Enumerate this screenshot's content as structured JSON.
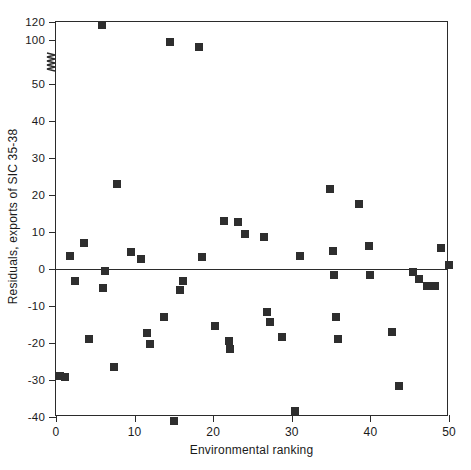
{
  "chart_data": {
    "type": "scatter",
    "title": "",
    "xlabel": "Environmental ranking",
    "ylabel": "Residuals, exports of SIC 35-38",
    "xlim": [
      0,
      50
    ],
    "ylim": [
      -40,
      120
    ],
    "grid": false,
    "legend": null,
    "axis_break": {
      "axis": "y",
      "between": [
        50,
        100
      ],
      "note": "broken y-axis squiggle drawn between the 50 and 100 ticks"
    },
    "xticks": [
      0,
      10,
      20,
      30,
      40,
      50
    ],
    "xtick_labels": [
      "0",
      "10",
      "20",
      "30",
      "40",
      "50"
    ],
    "yticks": [
      -40,
      -30,
      -20,
      -10,
      0,
      10,
      20,
      30,
      40,
      50,
      100,
      120
    ],
    "ytick_labels": [
      "-40",
      "-30",
      "-20",
      "-10",
      "0",
      "10",
      "20",
      "30",
      "40",
      "50",
      "100",
      "120"
    ],
    "reference_lines": [
      {
        "axis": "y",
        "value": 0
      }
    ],
    "marker": {
      "shape": "square",
      "color": "#2e2e2e",
      "size_px": 8
    },
    "series": [
      {
        "name": "Residuals, exports of SIC 35-38",
        "points": [
          [
            0.5,
            -29.0
          ],
          [
            1.2,
            -29.2
          ],
          [
            1.8,
            3.5
          ],
          [
            2.4,
            -3.3
          ],
          [
            3.5,
            7.0
          ],
          [
            4.2,
            -19.0
          ],
          [
            5.8,
            117.0
          ],
          [
            6.0,
            -5.0
          ],
          [
            6.2,
            -0.6
          ],
          [
            7.4,
            -26.5
          ],
          [
            7.8,
            23.0
          ],
          [
            9.6,
            4.6
          ],
          [
            10.8,
            2.8
          ],
          [
            11.6,
            -17.4
          ],
          [
            12.0,
            -20.2
          ],
          [
            13.8,
            -13.0
          ],
          [
            14.5,
            98.0
          ],
          [
            15.0,
            -41.0
          ],
          [
            15.8,
            -5.5
          ],
          [
            16.2,
            -3.2
          ],
          [
            18.2,
            92.0
          ],
          [
            18.6,
            3.2
          ],
          [
            20.2,
            -15.5
          ],
          [
            21.4,
            13.0
          ],
          [
            22.0,
            -19.3
          ],
          [
            22.2,
            -21.6
          ],
          [
            23.2,
            12.8
          ],
          [
            24.0,
            9.6
          ],
          [
            26.4,
            8.8
          ],
          [
            26.8,
            -11.5
          ],
          [
            27.2,
            -14.2
          ],
          [
            28.8,
            -18.3
          ],
          [
            30.4,
            -38.5
          ],
          [
            31.0,
            3.6
          ],
          [
            34.8,
            21.6
          ],
          [
            35.2,
            4.8
          ],
          [
            35.4,
            -1.5
          ],
          [
            35.6,
            -13.0
          ],
          [
            35.9,
            -19.0
          ],
          [
            38.6,
            17.6
          ],
          [
            39.8,
            6.2
          ],
          [
            40.0,
            -1.5
          ],
          [
            42.8,
            -17.0
          ],
          [
            43.6,
            -31.5
          ],
          [
            45.4,
            -0.8
          ],
          [
            46.2,
            -2.6
          ],
          [
            47.2,
            -4.6
          ],
          [
            48.2,
            -4.6
          ],
          [
            49.0,
            5.8
          ],
          [
            50.0,
            1.0
          ]
        ]
      }
    ]
  }
}
